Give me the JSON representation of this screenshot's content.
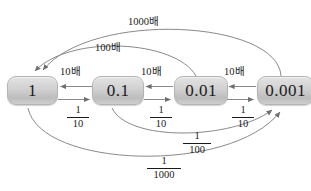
{
  "diagram": {
    "nodes": [
      {
        "id": "one",
        "label": "1"
      },
      {
        "id": "tenth",
        "label": "0.1"
      },
      {
        "id": "hundredth",
        "label": "0.01"
      },
      {
        "id": "thousandth",
        "label": "0.001"
      }
    ],
    "multiply_labels": [
      {
        "id": "x10-a",
        "text": "10배"
      },
      {
        "id": "x10-b",
        "text": "10배"
      },
      {
        "id": "x10-c",
        "text": "10배"
      },
      {
        "id": "x100",
        "text": "100배"
      },
      {
        "id": "x1000",
        "text": "1000배"
      }
    ],
    "divide_labels": [
      {
        "id": "d10-a",
        "numerator": "1",
        "denominator": "10"
      },
      {
        "id": "d10-b",
        "numerator": "1",
        "denominator": "10"
      },
      {
        "id": "d10-c",
        "numerator": "1",
        "denominator": "10"
      },
      {
        "id": "d100",
        "numerator": "1",
        "denominator": "100"
      },
      {
        "id": "d1000",
        "numerator": "1",
        "denominator": "1000"
      }
    ],
    "colors": {
      "node_fill_light": "#e3e3e3",
      "node_fill_dark": "#bdbdbd",
      "node_border": "#b4b4b4",
      "stroke": "#8a8a8a",
      "text": "#1a1a1a",
      "background": "#ffffff"
    }
  }
}
